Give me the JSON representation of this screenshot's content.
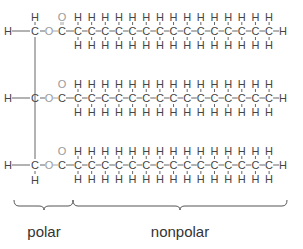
{
  "diagram": {
    "colors": {
      "carbon": "#444444",
      "hydrogen": "#444444",
      "oxygen": "#9a9a9a",
      "bond": "#555555",
      "label": "#333333"
    },
    "symbols": {
      "carbon": "C",
      "hydrogen": "H",
      "oxygen": "O"
    },
    "glycerol_backbone": {
      "carbon_x": 35,
      "rows_y": [
        31,
        98,
        165
      ],
      "top_h": "H",
      "bottom_h": "H"
    },
    "chains": [
      {
        "row": 1,
        "carbonyl_double_bond_visible": true,
        "chain_carbons": 16,
        "terminal": "H"
      },
      {
        "row": 2,
        "carbonyl_double_bond_visible": false,
        "chain_carbons": 16,
        "terminal": "H"
      },
      {
        "row": 3,
        "carbonyl_double_bond_visible": false,
        "chain_carbons": 16,
        "terminal": "H"
      }
    ],
    "regions": [
      {
        "label": "polar",
        "brace_x1": 14,
        "brace_x2": 73,
        "tip_x": 44,
        "label_x": 44
      },
      {
        "label": "nonpolar",
        "brace_x1": 73,
        "brace_x2": 287,
        "tip_x": 180,
        "label_x": 180
      }
    ]
  }
}
